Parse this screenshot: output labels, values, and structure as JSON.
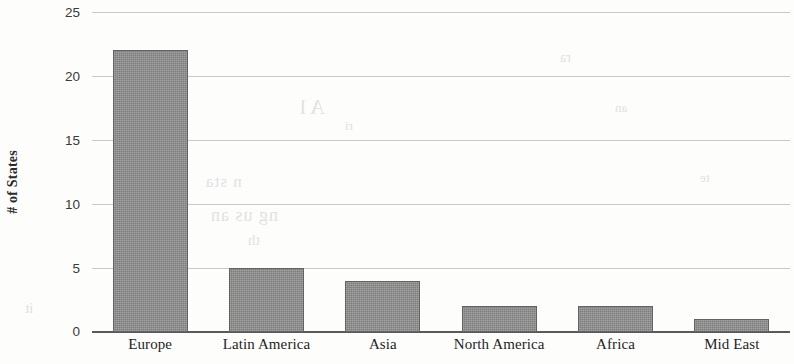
{
  "chart_data": {
    "type": "bar",
    "title": "",
    "subtitle": "",
    "xlabel": "",
    "ylabel": "# of States",
    "categories": [
      "Europe",
      "Latin America",
      "Asia",
      "North America",
      "Africa",
      "Mid East"
    ],
    "values": [
      22,
      5,
      4,
      2,
      2,
      1
    ],
    "ylim": [
      0,
      25
    ],
    "ytick_values": [
      0,
      5,
      10,
      15,
      20,
      25
    ],
    "ytick_labels": [
      "0",
      "5",
      "10",
      "15",
      "20",
      "25"
    ],
    "grid": true,
    "grid_axis": "y",
    "legend": false,
    "legend_position": "none",
    "orientation": "vertical",
    "bar_color": "#8c8c8c",
    "bar_border_color": "#636363",
    "gridline_color": "#c9c9c9",
    "axis_color": "#5a5a5a",
    "background_color": "#fdfdfc",
    "series": [
      {
        "name": "# of States",
        "values": [
          22,
          5,
          4,
          2,
          2,
          1
        ]
      }
    ]
  },
  "artifacts": {
    "description": "faint scanner bleed-through ghost text",
    "ghost_text": [
      "A l",
      "n sta",
      "ng us an",
      "th",
      "ra",
      "an",
      "te",
      "it",
      "ri"
    ]
  }
}
